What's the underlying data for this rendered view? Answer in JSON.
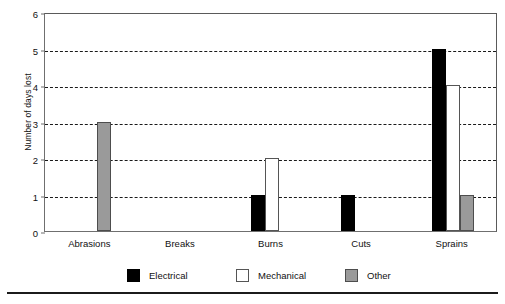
{
  "chart_data": {
    "type": "bar",
    "title": "",
    "subtitle": "",
    "xlabel": "",
    "ylabel": "Number of days lost",
    "categories": [
      "Abrasions",
      "Breaks",
      "Burns",
      "Cuts",
      "Sprains"
    ],
    "series": [
      {
        "name": "Electrical",
        "color": "#000000",
        "values": [
          0,
          0,
          1,
          1,
          5
        ]
      },
      {
        "name": "Mechanical",
        "color": "#ffffff",
        "values": [
          0,
          0,
          2,
          0,
          4
        ]
      },
      {
        "name": "Other",
        "color": "#9a9a9a",
        "values": [
          3,
          0,
          0,
          0,
          1
        ]
      }
    ],
    "ylim": [
      0,
      6
    ],
    "yticks": [
      0,
      1,
      2,
      3,
      4,
      5,
      6
    ],
    "ytick_labels": [
      "0",
      "1",
      "2",
      "3",
      "4",
      "5",
      "6"
    ],
    "grid": true,
    "grid_style": "dashed",
    "grid_axis": "y",
    "legend_position": "bottom",
    "legend": [
      "Electrical",
      "Mechanical",
      "Other"
    ],
    "bar_orientation": "vertical",
    "annotations": []
  },
  "axes": {
    "y_title": "Number of days lost",
    "y_tick_labels": [
      "6",
      "5",
      "4",
      "3",
      "2",
      "1",
      "0"
    ],
    "x_tick_labels": [
      "Abrasions",
      "Breaks",
      "Burns",
      "Cuts",
      "Sprains"
    ]
  },
  "legend": {
    "items": [
      {
        "label": "Electrical",
        "swatch": "electrical"
      },
      {
        "label": "Mechanical",
        "swatch": "mechanical"
      },
      {
        "label": "Other",
        "swatch": "other"
      }
    ]
  },
  "colors": {
    "electrical": "#000000",
    "mechanical": "#ffffff",
    "other": "#9a9a9a",
    "grid": "#1a1a1a",
    "frame": "#6f6f6f"
  }
}
